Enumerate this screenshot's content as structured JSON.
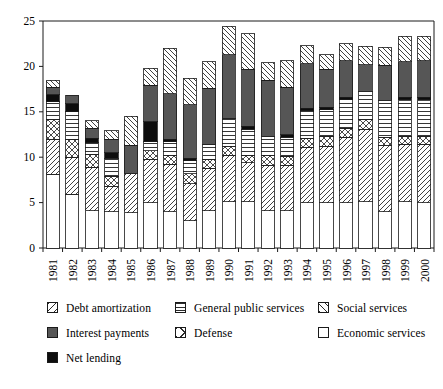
{
  "chart_data": {
    "type": "bar",
    "stacked": true,
    "title": "",
    "subtitle": "",
    "xlabel": "",
    "ylabel": "",
    "grid": false,
    "legend_position": "bottom",
    "ylim": [
      0,
      25
    ],
    "yticks": [
      0,
      5,
      10,
      15,
      20,
      25
    ],
    "ytick_labels": [
      "0",
      "5",
      "10",
      "15",
      "20",
      "25"
    ],
    "categories": [
      "1981",
      "1982",
      "1983",
      "1984",
      "1985",
      "1986",
      "1987",
      "1988",
      "1989",
      "1990",
      "1991",
      "1992",
      "1993",
      "1994",
      "1995",
      "1996",
      "1997",
      "1998",
      "1999",
      "2000"
    ],
    "stack_order_bottom_to_top": [
      "Economic services",
      "Social services",
      "Defense",
      "General public services",
      "Net lending",
      "Interest payments",
      "Debt amortization"
    ],
    "series": [
      {
        "name": "Economic services",
        "pattern": "blank",
        "values": [
          8.1,
          5.9,
          4.1,
          4.0,
          3.9,
          5.0,
          4.0,
          3.0,
          4.1,
          5.1,
          5.1,
          4.1,
          4.1,
          5.0,
          5.0,
          5.0,
          5.1,
          4.0,
          5.1,
          5.0
        ]
      },
      {
        "name": "Social services",
        "pattern": "forward-diagonal",
        "values": [
          3.9,
          4.1,
          4.8,
          2.8,
          4.3,
          4.8,
          5.2,
          4.1,
          4.7,
          5.1,
          4.3,
          5.0,
          5.0,
          6.1,
          6.2,
          7.2,
          8.0,
          7.3,
          6.3,
          6.4
        ]
      },
      {
        "name": "Defense",
        "pattern": "cross-diagonal",
        "values": [
          2.1,
          1.9,
          1.4,
          1.1,
          0.0,
          0.9,
          1.0,
          1.1,
          0.9,
          1.0,
          0.8,
          1.1,
          1.0,
          1.0,
          1.1,
          1.0,
          1.0,
          0.9,
          0.9,
          0.9
        ]
      },
      {
        "name": "General public services",
        "pattern": "horizontal",
        "values": [
          2.0,
          3.1,
          1.3,
          2.0,
          0.0,
          1.0,
          1.5,
          1.4,
          1.7,
          3.1,
          2.9,
          2.1,
          2.1,
          3.0,
          2.9,
          3.2,
          3.1,
          4.0,
          4.0,
          4.0
        ]
      },
      {
        "name": "Net lending",
        "pattern": "solid-black",
        "values": [
          0.8,
          0.9,
          0.5,
          0.6,
          0.0,
          2.2,
          0.3,
          0.3,
          0.0,
          0.0,
          0.3,
          0.0,
          0.3,
          0.3,
          0.3,
          0.2,
          0.0,
          0.0,
          0.3,
          0.3
        ]
      },
      {
        "name": "Interest payments",
        "pattern": "solid-gray",
        "values": [
          0.8,
          0.9,
          1.1,
          1.5,
          3.1,
          4.0,
          5.0,
          5.9,
          6.2,
          7.0,
          6.3,
          6.2,
          5.2,
          4.9,
          4.2,
          4.0,
          3.0,
          3.9,
          3.9,
          4.0
        ]
      },
      {
        "name": "Debt amortization",
        "pattern": "back-diagonal",
        "values": [
          0.8,
          0.0,
          0.8,
          0.9,
          3.2,
          1.9,
          5.0,
          2.9,
          2.9,
          3.1,
          3.9,
          1.9,
          2.9,
          2.0,
          1.6,
          1.9,
          2.0,
          2.0,
          2.8,
          2.7
        ]
      }
    ],
    "totals": [
      18.5,
      16.8,
      14.0,
      12.9,
      14.5,
      19.8,
      22.0,
      18.7,
      20.5,
      24.4,
      23.6,
      20.4,
      20.6,
      22.3,
      21.3,
      22.5,
      22.2,
      22.1,
      23.3,
      23.3
    ]
  },
  "legend": {
    "items": [
      {
        "label": "Debt amortization",
        "pattern": "back-diagonal"
      },
      {
        "label": "General public services",
        "pattern": "horizontal"
      },
      {
        "label": "Social services",
        "pattern": "forward-diagonal"
      },
      {
        "label": "Interest payments",
        "pattern": "solid-gray"
      },
      {
        "label": "Defense",
        "pattern": "cross-diagonal"
      },
      {
        "label": "Economic services",
        "pattern": "blank"
      },
      {
        "label": "Net lending",
        "pattern": "solid-black"
      }
    ]
  },
  "colors": {
    "axis": "#1a1a1a",
    "gray_fill": "#565656",
    "black_fill": "#0d0d0d",
    "white_fill": "#ffffff",
    "hatch_stroke": "#2b2b2b"
  }
}
